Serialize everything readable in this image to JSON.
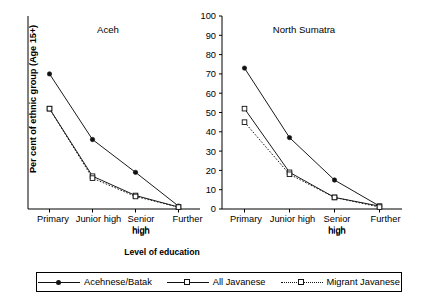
{
  "axis": {
    "ylabel": "Per cent of ethnic group (Age 15+)",
    "xlabel": "Level of education",
    "yticks": [
      "0",
      "10",
      "20",
      "30",
      "40",
      "50",
      "60",
      "70",
      "80",
      "90",
      "100"
    ],
    "categories": [
      "Primary",
      "Junior high",
      "Senior high",
      "Further"
    ]
  },
  "panels": [
    {
      "title": "Aceh"
    },
    {
      "title": "North Sumatra"
    }
  ],
  "legend": {
    "items": [
      {
        "label": "Acehnese/Batak",
        "marker": "filled-diamond",
        "line": "solid"
      },
      {
        "label": "All Javanese",
        "marker": "open-square",
        "line": "solid"
      },
      {
        "label": "Migrant Javanese",
        "marker": "open-square",
        "line": "dotted"
      }
    ]
  },
  "chart_data": [
    {
      "type": "line",
      "title": "Aceh",
      "xlabel": "Level of education",
      "ylabel": "Per cent of ethnic group (Age 15+)",
      "categories": [
        "Primary",
        "Junior high",
        "Senior high",
        "Further"
      ],
      "ylim": [
        0,
        100
      ],
      "ytick_step": 10,
      "grid": false,
      "legend_position": "bottom",
      "series": [
        {
          "name": "Acehnese/Batak",
          "values": [
            70,
            36,
            19,
            1.5
          ],
          "marker": "filled-diamond",
          "line": "solid"
        },
        {
          "name": "All Javanese",
          "values": [
            52,
            17,
            7,
            1
          ],
          "marker": "open-square",
          "line": "solid"
        },
        {
          "name": "Migrant Javanese",
          "values": [
            52,
            16,
            6.5,
            1
          ],
          "marker": "open-square",
          "line": "dotted"
        }
      ]
    },
    {
      "type": "line",
      "title": "North Sumatra",
      "xlabel": "Level of education",
      "ylabel": "Per cent of ethnic group (Age 15+)",
      "categories": [
        "Primary",
        "Junior high",
        "Senior high",
        "Further"
      ],
      "ylim": [
        0,
        100
      ],
      "ytick_step": 10,
      "grid": false,
      "legend_position": "bottom",
      "series": [
        {
          "name": "Acehnese/Batak",
          "values": [
            73,
            37,
            15,
            1.5
          ],
          "marker": "filled-diamond",
          "line": "solid"
        },
        {
          "name": "All Javanese",
          "values": [
            52,
            19,
            6,
            1.5
          ],
          "marker": "open-square",
          "line": "solid"
        },
        {
          "name": "Migrant Javanese",
          "values": [
            45,
            18,
            6,
            1
          ],
          "marker": "open-square",
          "line": "dotted"
        }
      ]
    }
  ]
}
